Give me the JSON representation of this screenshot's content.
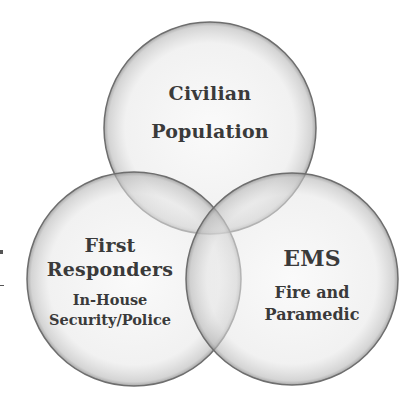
{
  "diagram": {
    "type": "venn",
    "circles": [
      {
        "id": "top",
        "cx": 210,
        "cy": 128,
        "r": 106,
        "title_lines": [
          "Civilian",
          "Population"
        ],
        "subtitle_lines": []
      },
      {
        "id": "left",
        "cx": 134,
        "cy": 279,
        "r": 107,
        "title_lines": [
          "First",
          "Responders"
        ],
        "subtitle_lines": [
          "In-House",
          "Security/Police"
        ]
      },
      {
        "id": "right",
        "cx": 292,
        "cy": 279,
        "r": 106,
        "title_lines": [
          "EMS"
        ],
        "subtitle_lines": [
          "Fire and",
          "Paramedic"
        ]
      }
    ],
    "colors": {
      "fill": "#e8e8e8",
      "edge": "#6a6a6a",
      "overlap": "#c9c9c9",
      "center": "#b3b3b3",
      "text": "#3a3a3a"
    }
  },
  "labels": {
    "top": {
      "line1": "Civilian",
      "line2": "Population"
    },
    "left": {
      "line1": "First",
      "line2": "Responders",
      "sub1": "In-House",
      "sub2": "Security/Police"
    },
    "right": {
      "line1": "EMS",
      "sub1": "Fire and",
      "sub2": "Paramedic"
    }
  }
}
